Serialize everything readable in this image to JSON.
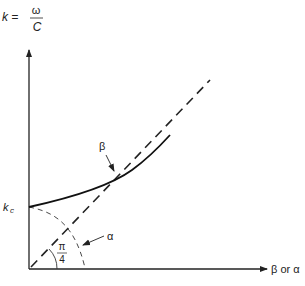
{
  "diagram": {
    "y_axis_label": {
      "lhs": "k =",
      "numerator": "ω",
      "denominator": "C"
    },
    "x_axis_label": "β or α",
    "kc_label": "k",
    "kc_subscript": "c",
    "beta_label": "β",
    "alpha_label": "α",
    "angle_label": {
      "numerator": "π",
      "denominator": "4"
    },
    "colors": {
      "line": "#222222",
      "background": "#ffffff"
    }
  }
}
